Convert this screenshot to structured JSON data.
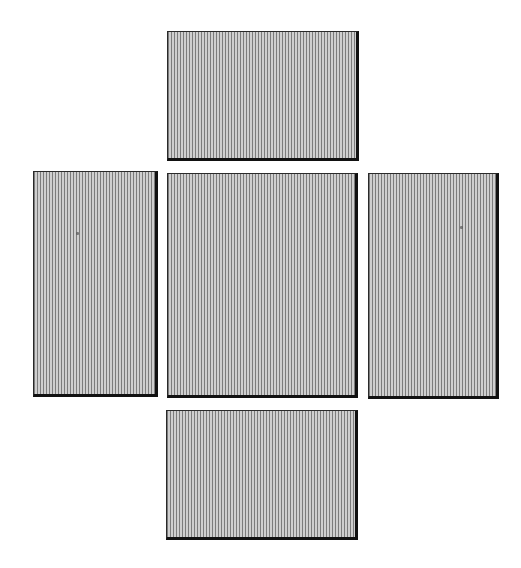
{
  "diagram": {
    "type": "box-net-cross",
    "colors": {
      "background": "#ffffff",
      "hatch_dark": "#7c7c7c",
      "hatch_light": "#cfcfcf",
      "border": "#111111"
    },
    "panels": [
      {
        "id": "top",
        "x": 167,
        "y": 31,
        "w": 192,
        "h": 130
      },
      {
        "id": "left",
        "x": 33,
        "y": 171,
        "w": 125,
        "h": 226
      },
      {
        "id": "center",
        "x": 167,
        "y": 173,
        "w": 191,
        "h": 225
      },
      {
        "id": "right",
        "x": 368,
        "y": 173,
        "w": 131,
        "h": 226
      },
      {
        "id": "bottom",
        "x": 166,
        "y": 410,
        "w": 192,
        "h": 130
      }
    ],
    "specks": [
      {
        "x": 76,
        "y": 232
      },
      {
        "x": 460,
        "y": 226
      }
    ]
  }
}
